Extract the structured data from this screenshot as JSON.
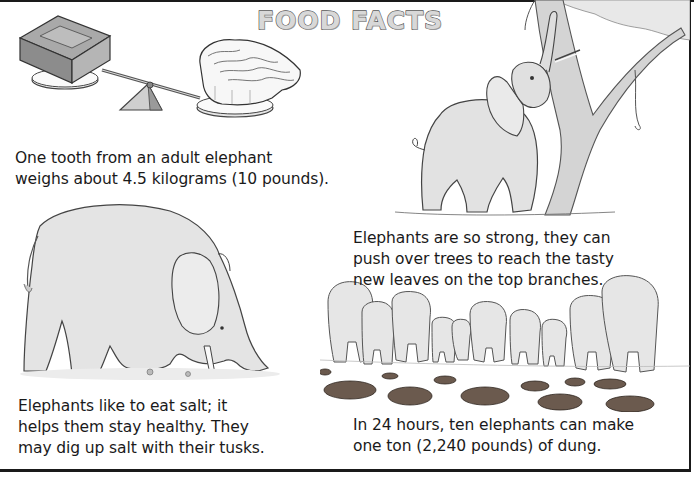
{
  "page": {
    "title": "FOOD FACTS"
  },
  "facts": [
    {
      "id": "tooth",
      "illustration": "balance-scale-brick-vs-elephant-tooth",
      "lines": [
        "One tooth from an adult elephant",
        "weighs about 4.5 kilograms (10 pounds)."
      ]
    },
    {
      "id": "strong",
      "illustration": "elephant-pushing-tree",
      "lines": [
        "Elephants are so strong, they can",
        "push over trees to reach the tasty",
        "new leaves on the top branches."
      ]
    },
    {
      "id": "salt",
      "illustration": "elephant-digging-salt-with-tusks",
      "lines": [
        "Elephants like to eat salt; it",
        "helps them stay healthy. They",
        "may dig up salt with their tusks."
      ]
    },
    {
      "id": "dung",
      "illustration": "ten-elephants-walking-away-leaving-dung",
      "lines": [
        "In 24 hours, ten elephants can make",
        "one ton (2,240 pounds) of dung."
      ]
    }
  ],
  "colors": {
    "ink": "#1a1a1a",
    "title_fill": "#d8d8d8",
    "title_stroke": "#555555",
    "elephant_gray": "#dcdcdc",
    "dung_brown": "#6b5a4e"
  }
}
